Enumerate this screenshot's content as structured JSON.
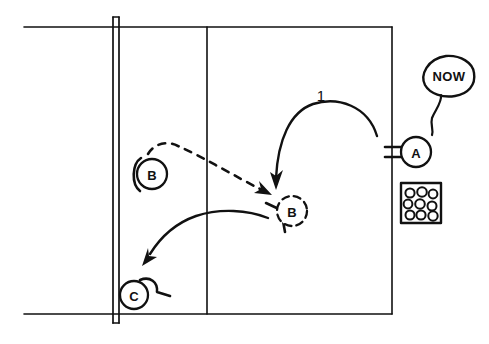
{
  "diagram": {
    "background_color": "#ffffff",
    "ink_color": "#111111"
  },
  "court": {
    "name": "court",
    "top_line_label": "baseline-top",
    "bottom_line_label": "baseline-bottom",
    "service_line_label": "service-line",
    "net_label": "net"
  },
  "markers": [
    {
      "id": "a",
      "label": "A",
      "role": "feeder",
      "style": "solid",
      "x": 416,
      "y": 152,
      "r": 15,
      "position_note": "outside right sideline"
    },
    {
      "id": "b1",
      "label": "B",
      "role": "player-start",
      "style": "solid",
      "x": 152,
      "y": 174,
      "r": 15,
      "position_note": "left of net, start position"
    },
    {
      "id": "b2",
      "label": "B",
      "role": "player-moved",
      "style": "dashed",
      "x": 292,
      "y": 211,
      "r": 15,
      "position_note": "right court, after movement"
    },
    {
      "id": "c",
      "label": "C",
      "role": "player-target",
      "style": "solid",
      "x": 134,
      "y": 295,
      "r": 14,
      "position_note": "bottom left at net"
    }
  ],
  "speech_bubble": {
    "text": "NOW",
    "speaker": "A",
    "x": 446,
    "y": 75
  },
  "ball_box": {
    "label": "ball-basket",
    "ball_count": 9,
    "rows": 3,
    "columns": 3,
    "x": 401,
    "y": 183,
    "width": 40,
    "height": 40
  },
  "arrows": [
    {
      "id": "feed-1",
      "label": "1",
      "style": "solid",
      "from": "A",
      "to": "B-moved",
      "meaning": "ball fed from A to B"
    },
    {
      "id": "move-b",
      "label": "",
      "style": "dashed",
      "from": "B-start",
      "to": "B-moved",
      "meaning": "player B moves across court"
    },
    {
      "id": "shot-2",
      "label": "",
      "style": "solid",
      "from": "B-moved",
      "to": "C",
      "meaning": "B hits ball toward C"
    }
  ],
  "step_labels": [
    {
      "text": "1",
      "x": 321,
      "y": 95
    }
  ]
}
